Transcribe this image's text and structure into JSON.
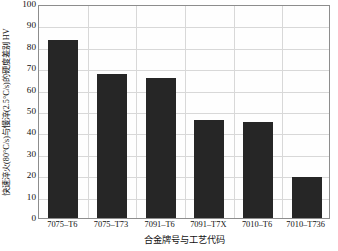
{
  "chart_data": {
    "type": "bar",
    "title": "",
    "categories": [
      "7075–T6",
      "7075–T73",
      "7091–T6",
      "7091–T7X",
      "7010–T6",
      "7010–T736"
    ],
    "values": [
      83,
      67.5,
      65.5,
      46,
      45,
      19
    ],
    "xlabel": "合金牌号与工艺代码",
    "ylabel": "快速淬火(80°C/s)与慢淬(2.5°C/s)的硬度差别 HV",
    "ylim": [
      0,
      100
    ],
    "yticks": [
      0,
      10,
      20,
      30,
      40,
      50,
      60,
      70,
      80,
      90,
      100
    ],
    "ytick_labels": [
      "0",
      "10",
      "20",
      "30",
      "40",
      "50",
      "60",
      "70",
      "80",
      "90",
      "100"
    ],
    "grid": true,
    "grid_color": "#d8d8d8",
    "bar_color": "#262626",
    "axis_color": "#8d8d8d",
    "legend": null,
    "legend_position": "none"
  }
}
